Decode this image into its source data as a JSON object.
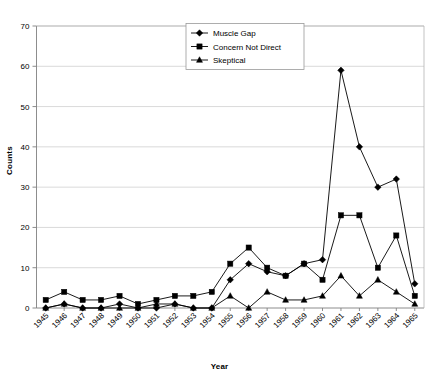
{
  "chart_data": {
    "type": "line",
    "title": "",
    "xlabel": "Year",
    "ylabel": "Counts",
    "ylim": [
      0,
      70
    ],
    "ytick_step": 10,
    "yticks": [
      0,
      10,
      20,
      30,
      40,
      50,
      60,
      70
    ],
    "grid": true,
    "legend_position": "top-center",
    "categories": [
      "1945",
      "1946",
      "1947",
      "1948",
      "1949",
      "1950",
      "1951",
      "1952",
      "1953",
      "1954",
      "1955",
      "1956",
      "1957",
      "1958",
      "1959",
      "1960",
      "1961",
      "1962",
      "1963",
      "1964",
      "1965"
    ],
    "series": [
      {
        "name": "Muscle Gap",
        "marker": "diamond",
        "color": "#000000",
        "values": [
          0,
          1,
          0,
          0,
          1,
          0,
          0,
          1,
          0,
          0,
          7,
          11,
          9,
          8,
          11,
          12,
          59,
          40,
          30,
          32,
          6
        ]
      },
      {
        "name": "Concern Not Direct",
        "marker": "square",
        "color": "#000000",
        "values": [
          2,
          4,
          2,
          2,
          3,
          1,
          2,
          3,
          3,
          4,
          11,
          15,
          10,
          8,
          11,
          7,
          23,
          23,
          10,
          18,
          3
        ]
      },
      {
        "name": "Skeptical",
        "marker": "triangle",
        "color": "#000000",
        "values": [
          0,
          1,
          0,
          0,
          0,
          0,
          1,
          1,
          0,
          0,
          3,
          0,
          4,
          2,
          2,
          3,
          8,
          3,
          7,
          4,
          1
        ]
      }
    ]
  },
  "legend": {
    "items": [
      {
        "label": "Muscle Gap",
        "marker": "diamond"
      },
      {
        "label": "Concern Not Direct",
        "marker": "square"
      },
      {
        "label": "Skeptical",
        "marker": "triangle"
      }
    ]
  },
  "axis": {
    "y_title": "Counts",
    "x_title": "Year"
  }
}
